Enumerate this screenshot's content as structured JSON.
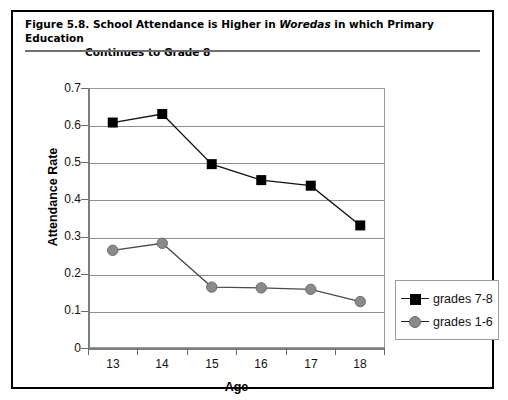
{
  "figure": {
    "number": "Figure 5.8.",
    "title_part1": "School Attendance is Higher in ",
    "title_italic": "Woredas",
    "title_part2": " in which Primary Education",
    "title_line2": "Continues to Grade 8"
  },
  "legend": {
    "position": "right",
    "items": [
      {
        "label": "grades 7-8",
        "marker": "square",
        "color": "#000000"
      },
      {
        "label": "grades 1-6",
        "marker": "circle",
        "color": "#8a8a8a"
      }
    ]
  },
  "axes": {
    "y_title": "Attendance Rate",
    "x_title": "Age",
    "y_ticks": [
      "0.7",
      "0.6",
      "0.5",
      "0.4",
      "0.3",
      "0.2",
      "0.1",
      "0"
    ],
    "x_ticks": [
      "13",
      "14",
      "15",
      "16",
      "17",
      "18"
    ]
  },
  "chart_data": {
    "type": "line",
    "title": "School Attendance is Higher in Woredas in which Primary Education Continues to Grade 8",
    "xlabel": "Age",
    "ylabel": "Attendance Rate",
    "categories": [
      "13",
      "14",
      "15",
      "16",
      "17",
      "18"
    ],
    "x": [
      13,
      14,
      15,
      16,
      17,
      18
    ],
    "series": [
      {
        "name": "grades 7-8",
        "marker": "square",
        "color": "#000000",
        "values": [
          0.607,
          0.63,
          0.495,
          0.452,
          0.437,
          0.33
        ]
      },
      {
        "name": "grades 1-6",
        "marker": "circle",
        "color": "#8a8a8a",
        "values": [
          0.263,
          0.282,
          0.164,
          0.162,
          0.158,
          0.125
        ]
      }
    ],
    "ylim": [
      0,
      0.7
    ],
    "ytick_step": 0.1,
    "grid": "horizontal",
    "legend_position": "right"
  }
}
